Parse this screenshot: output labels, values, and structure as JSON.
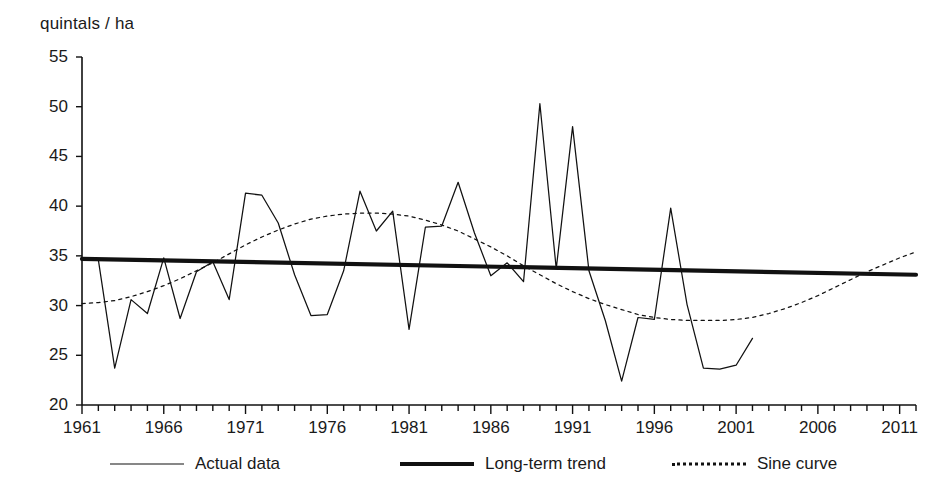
{
  "chart_data": {
    "type": "line",
    "title": "",
    "ylabel": "quintals / ha",
    "xlabel": "",
    "ylim": [
      20,
      55
    ],
    "xlim": [
      1961,
      2012
    ],
    "yticks": [
      55,
      50,
      45,
      40,
      35,
      30,
      25,
      20
    ],
    "xticks": [
      1961,
      1966,
      1971,
      1976,
      1981,
      1986,
      1991,
      1996,
      2001,
      2006,
      2011
    ],
    "minor_x_tick_step": 1,
    "grid": false,
    "legend_position": "bottom",
    "series": [
      {
        "name": "Actual data",
        "style": "thin-solid",
        "color": "#111111",
        "x": [
          1961,
          1962,
          1963,
          1964,
          1965,
          1966,
          1967,
          1968,
          1969,
          1970,
          1971,
          1972,
          1973,
          1974,
          1975,
          1976,
          1977,
          1978,
          1979,
          1980,
          1981,
          1982,
          1983,
          1984,
          1985,
          1986,
          1987,
          1988,
          1989,
          1990,
          1991,
          1992,
          1993,
          1994,
          1995,
          1996,
          1997,
          1998,
          1999,
          2000,
          2001,
          2002
        ],
        "values": [
          34.7,
          34.6,
          23.7,
          30.6,
          29.2,
          34.8,
          28.7,
          33.4,
          34.4,
          30.6,
          41.3,
          41.1,
          38.3,
          33.1,
          29.0,
          29.1,
          33.5,
          41.5,
          37.5,
          39.5,
          27.6,
          37.9,
          38.0,
          42.4,
          37.3,
          33.0,
          34.3,
          32.4,
          50.3,
          33.7,
          48.0,
          33.5,
          28.5,
          22.4,
          28.8,
          28.6,
          39.8,
          30.1,
          23.7,
          23.6,
          24.0,
          26.7
        ]
      },
      {
        "name": "Long-term trend",
        "style": "thick-solid",
        "color": "#111111",
        "x": [
          1961,
          2012
        ],
        "values": [
          34.7,
          33.1
        ]
      },
      {
        "name": "Sine curve",
        "style": "dotted",
        "color": "#111111",
        "x": [
          1961,
          1962,
          1963,
          1964,
          1965,
          1966,
          1967,
          1968,
          1969,
          1970,
          1971,
          1972,
          1973,
          1974,
          1975,
          1976,
          1977,
          1978,
          1979,
          1980,
          1981,
          1982,
          1983,
          1984,
          1985,
          1986,
          1987,
          1988,
          1989,
          1990,
          1991,
          1992,
          1993,
          1994,
          1995,
          1996,
          1997,
          1998,
          1999,
          2000,
          2001,
          2002,
          2003,
          2004,
          2005,
          2006,
          2007,
          2008,
          2009,
          2010,
          2011,
          2012
        ],
        "values": [
          30.2,
          30.3,
          30.5,
          30.9,
          31.4,
          32.0,
          32.7,
          33.5,
          34.3,
          35.2,
          36.1,
          36.9,
          37.6,
          38.2,
          38.7,
          39.0,
          39.2,
          39.3,
          39.3,
          39.2,
          39.0,
          38.6,
          38.1,
          37.5,
          36.7,
          35.9,
          35.0,
          34.0,
          33.1,
          32.2,
          31.4,
          30.7,
          30.1,
          29.6,
          29.1,
          28.8,
          28.6,
          28.5,
          28.5,
          28.5,
          28.6,
          28.8,
          29.2,
          29.7,
          30.3,
          31.0,
          31.8,
          32.6,
          33.4,
          34.1,
          34.8,
          35.4
        ]
      }
    ]
  },
  "legend": {
    "items": [
      {
        "label": "Actual data",
        "style": "thin-solid"
      },
      {
        "label": "Long-term trend",
        "style": "thick-solid"
      },
      {
        "label": "Sine curve",
        "style": "dotted"
      }
    ]
  },
  "colors": {
    "ink": "#111111",
    "background": "#ffffff"
  }
}
